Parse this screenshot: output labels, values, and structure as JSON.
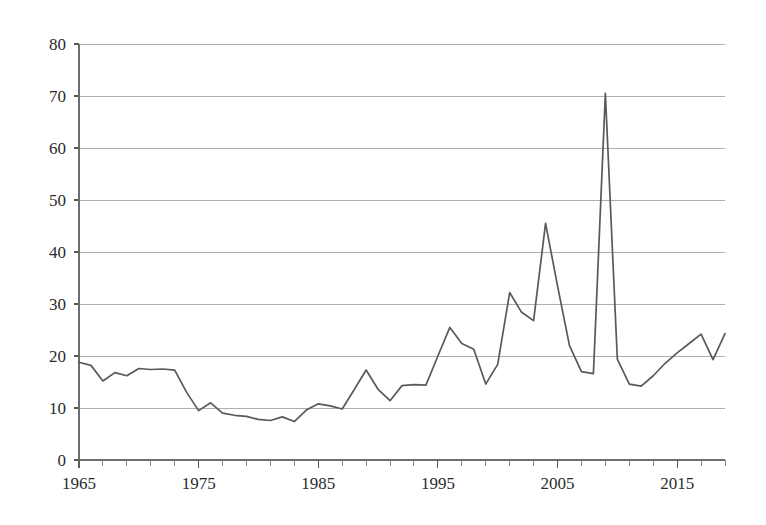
{
  "chart_data": {
    "type": "line",
    "title": "",
    "subtitle": "",
    "xlabel": "",
    "ylabel": "",
    "xlim": [
      1965,
      2019
    ],
    "ylim": [
      0,
      80
    ],
    "grid": true,
    "legend": "none",
    "y_ticks": [
      0,
      10,
      20,
      30,
      40,
      50,
      60,
      70,
      80
    ],
    "y_tick_labels": [
      "0",
      "10",
      "20",
      "30",
      "40",
      "50",
      "60",
      "70",
      "80"
    ],
    "x_major_ticks": [
      1965,
      1975,
      1985,
      1995,
      2005,
      2015
    ],
    "x_major_tick_labels": [
      "1965",
      "1975",
      "1985",
      "1995",
      "2005",
      "2015"
    ],
    "x_minor_tick_step": 2,
    "series": [
      {
        "name": "series-1",
        "color": "#595959",
        "x": [
          1965,
          1966,
          1967,
          1968,
          1969,
          1970,
          1971,
          1972,
          1973,
          1974,
          1975,
          1976,
          1977,
          1978,
          1979,
          1980,
          1981,
          1982,
          1983,
          1984,
          1985,
          1986,
          1987,
          1988,
          1989,
          1990,
          1991,
          1992,
          1993,
          1994,
          1995,
          1996,
          1997,
          1998,
          1999,
          2000,
          2001,
          2002,
          2003,
          2004,
          2005,
          2006,
          2007,
          2008,
          2009,
          2010,
          2011,
          2012,
          2013,
          2014,
          2015,
          2016,
          2017,
          2018,
          2019
        ],
        "values": [
          18.8,
          18.2,
          15.2,
          16.8,
          16.2,
          17.6,
          17.4,
          17.5,
          17.3,
          13.0,
          9.5,
          11.0,
          9.0,
          8.6,
          8.4,
          7.8,
          7.6,
          8.3,
          7.4,
          9.6,
          10.8,
          10.4,
          9.8,
          13.5,
          17.3,
          13.6,
          11.4,
          14.3,
          14.5,
          14.4,
          20.0,
          25.5,
          22.4,
          21.3,
          14.6,
          18.4,
          32.2,
          28.4,
          26.8,
          45.5,
          33.5,
          22.0,
          17.0,
          16.6,
          70.5,
          19.4,
          14.6,
          14.2,
          16.2,
          18.6,
          20.6,
          22.4,
          24.2,
          19.3,
          24.3
        ]
      }
    ]
  }
}
